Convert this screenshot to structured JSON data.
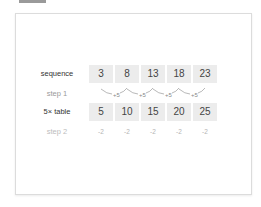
{
  "rows": {
    "sequence": {
      "label": "sequence",
      "values": [
        "3",
        "8",
        "13",
        "18",
        "23"
      ]
    },
    "step1": {
      "label": "step 1",
      "differences": [
        "+5",
        "+5",
        "+5",
        "+5"
      ]
    },
    "table5": {
      "label": "5× table",
      "values": [
        "5",
        "10",
        "15",
        "20",
        "25"
      ]
    },
    "step2": {
      "label": "step 2",
      "differences": [
        "-2",
        "-2",
        "-2",
        "-2",
        "-2"
      ]
    }
  },
  "colors": {
    "cell_bg": "#ececec",
    "text": "#444444",
    "muted": "#9a9a9a"
  }
}
